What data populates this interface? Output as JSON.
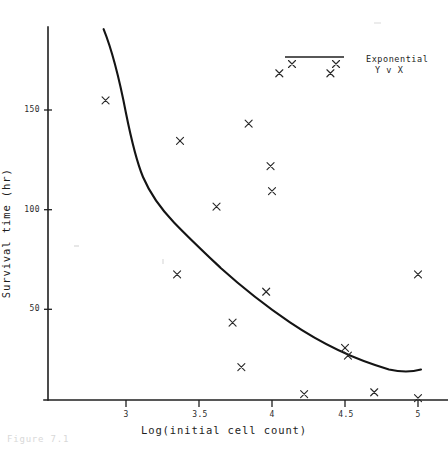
{
  "figure": {
    "caption": "Figure 7.1"
  },
  "legend": {
    "line_label": "Exponential",
    "series_label": "Y v X",
    "position": "top-right"
  },
  "axes": {
    "x_title": "Log(initial cell count)",
    "y_title": "Survival time (hr)",
    "x_ticks": [
      "3",
      "3.5",
      "4",
      "4.5",
      "5"
    ],
    "y_ticks": [
      "50",
      "100",
      "150"
    ]
  },
  "chart_data": {
    "type": "scatter",
    "title": "",
    "subtitle": "",
    "xlabel": "Log(initial cell count)",
    "ylabel": "Survival time (hr)",
    "xlim": [
      2.62,
      5.2
    ],
    "ylim": [
      0,
      196
    ],
    "xticks": [
      3,
      3.5,
      4,
      4.5,
      5
    ],
    "yticks": [
      50,
      100,
      150
    ],
    "grid": false,
    "legend_position": "top-right",
    "series": [
      {
        "name": "Y v X",
        "type": "scatter",
        "marker": "x",
        "color": "#2a2a2a",
        "x": [
          2.86,
          3.35,
          3.37,
          3.62,
          3.73,
          3.79,
          3.84,
          3.96,
          3.99,
          4.0,
          4.05,
          4.22,
          4.4,
          4.5,
          4.52,
          4.7,
          5.0,
          5.0
        ],
        "y": [
          155,
          65,
          134,
          100,
          40,
          17,
          143,
          56,
          121,
          108,
          169,
          3,
          169,
          27,
          23,
          4,
          65,
          1
        ]
      },
      {
        "name": "Exponential",
        "type": "line",
        "color": "#141414",
        "x": [
          2.845,
          2.95,
          3.05,
          3.15,
          3.25,
          3.35,
          3.45,
          3.55,
          3.65,
          3.75,
          3.85,
          3.95,
          4.05,
          4.15,
          4.25,
          4.35,
          4.45,
          4.55,
          4.65,
          4.75,
          4.85,
          4.95,
          5.02
        ],
        "y": [
          191,
          178,
          163,
          146,
          128,
          117,
          109,
          102,
          95,
          87,
          80,
          73,
          66,
          59,
          53,
          47,
          42,
          38,
          34,
          30,
          27,
          24,
          22
        ]
      }
    ]
  }
}
